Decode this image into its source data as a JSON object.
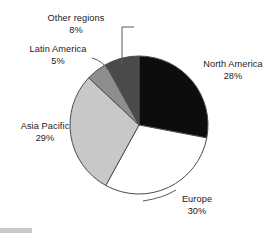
{
  "chart_data": {
    "type": "pie",
    "title": "",
    "subtitle": "",
    "xlabel": "",
    "ylabel": "",
    "legend_position": "none",
    "grid": false,
    "units": "percent",
    "start_angle_deg": 0,
    "direction": "clockwise",
    "categories": [
      "North America",
      "Europe",
      "Asia Pacific",
      "Latin America",
      "Other regions"
    ],
    "values": [
      28,
      30,
      29,
      5,
      8
    ],
    "slices": [
      {
        "label": "North America",
        "value": 28,
        "value_text": "28%",
        "color": "#0d0d0d",
        "start_deg": 0,
        "end_deg": 100.8,
        "label_placement": "right",
        "has_leader_line": false
      },
      {
        "label": "Europe",
        "value": 30,
        "value_text": "30%",
        "color": "#ffffff",
        "start_deg": 100.8,
        "end_deg": 208.8,
        "label_placement": "bottom-right",
        "has_leader_line": true
      },
      {
        "label": "Asia Pacific",
        "value": 29,
        "value_text": "29%",
        "color": "#c8c8c8",
        "start_deg": 208.8,
        "end_deg": 313.2,
        "label_placement": "left",
        "has_leader_line": false
      },
      {
        "label": "Latin America",
        "value": 5,
        "value_text": "5%",
        "color": "#8e8e8e",
        "start_deg": 313.2,
        "end_deg": 331.2,
        "label_placement": "upper-left",
        "has_leader_line": true
      },
      {
        "label": "Other regions",
        "value": 8,
        "value_text": "8%",
        "color": "#4a4a4a",
        "start_deg": 331.2,
        "end_deg": 360,
        "label_placement": "top",
        "has_leader_line": true
      }
    ]
  },
  "labels": {
    "north_america": {
      "name": "North America",
      "pct": "28%"
    },
    "europe": {
      "name": "Europe",
      "pct": "30%"
    },
    "asia_pacific": {
      "name": "Asia Pacific",
      "pct": "29%"
    },
    "latin_america": {
      "name": "Latin America",
      "pct": "5%"
    },
    "other_regions": {
      "name": "Other regions",
      "pct": "8%"
    }
  },
  "style": {
    "background": "#ffffff",
    "outline": "#4d4d4d",
    "text_color": "#1a1a1a"
  }
}
